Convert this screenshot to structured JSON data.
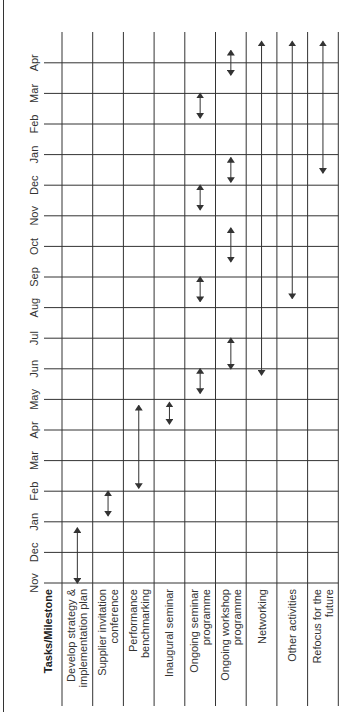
{
  "chart_data": {
    "type": "gantt",
    "title": "",
    "orientation": "rotated-90-ccw",
    "header_label": "Tasks/Milestone",
    "months": [
      "Nov",
      "Dec",
      "Jan",
      "Feb",
      "Mar",
      "Apr",
      "May",
      "Jun",
      "Jul",
      "Aug",
      "Sep",
      "Oct",
      "Nov",
      "Dec",
      "Jan",
      "Feb",
      "Mar",
      "Apr"
    ],
    "tasks": [
      {
        "name": "Develop strategy & implementation plan",
        "lines": [
          "Develop strategy &",
          "implementation plan"
        ],
        "bars": [
          {
            "start": 0.0,
            "end": 1.8
          }
        ]
      },
      {
        "name": "Supplier invitation conference",
        "lines": [
          "Supplier invitation",
          "conference"
        ],
        "bars": [
          {
            "start": 2.2,
            "end": 3.0
          }
        ]
      },
      {
        "name": "Performance benchmarking",
        "lines": [
          "Performance",
          "benchmarking"
        ],
        "bars": [
          {
            "start": 3.1,
            "end": 5.8
          }
        ]
      },
      {
        "name": "Inaugural seminar",
        "lines": [
          "Inaugural seminar"
        ],
        "bars": [
          {
            "start": 5.2,
            "end": 5.9
          }
        ]
      },
      {
        "name": "Ongoing seminar programme",
        "lines": [
          "Ongoing seminar",
          "programme"
        ],
        "bars": [
          {
            "start": 6.2,
            "end": 7.0
          },
          {
            "start": 9.2,
            "end": 10.0
          },
          {
            "start": 12.2,
            "end": 13.0
          },
          {
            "start": 15.2,
            "end": 16.0
          }
        ]
      },
      {
        "name": "Ongoing workshop programme",
        "lines": [
          "Ongoing workshop",
          "programme"
        ],
        "bars": [
          {
            "start": 7.0,
            "end": 8.0
          },
          {
            "start": 10.5,
            "end": 11.6
          },
          {
            "start": 13.1,
            "end": 13.9
          },
          {
            "start": 16.6,
            "end": 17.4
          }
        ]
      },
      {
        "name": "Networking",
        "lines": [
          "Networking"
        ],
        "bars": [
          {
            "start": 6.8,
            "end": 17.7
          }
        ]
      },
      {
        "name": "Other activities",
        "lines": [
          "Other activities"
        ],
        "bars": [
          {
            "start": 9.3,
            "end": 17.7
          }
        ]
      },
      {
        "name": "Refocus for the future",
        "lines": [
          "Refocus for the",
          "future"
        ],
        "bars": [
          {
            "start": 13.4,
            "end": 17.7
          }
        ]
      }
    ],
    "arrow_style": "double-headed",
    "grid": true,
    "line_color": "#333333"
  }
}
